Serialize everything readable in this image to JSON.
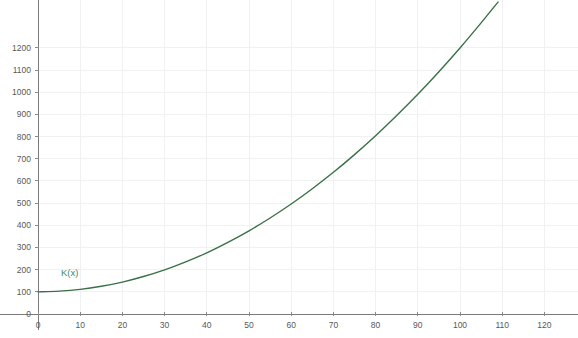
{
  "chart_data": {
    "type": "line",
    "title": "",
    "subtitle": "",
    "xlabel": "",
    "ylabel": "",
    "xlim": [
      -2,
      127
    ],
    "ylim": [
      -35,
      1420
    ],
    "grid": true,
    "grid_color": "#f0f1f3",
    "legend_position": "inline-annotation",
    "x_ticks": [
      0,
      10,
      20,
      30,
      40,
      50,
      60,
      70,
      80,
      90,
      100,
      110,
      120
    ],
    "x_tick_labels": [
      "0",
      "10",
      "20",
      "30",
      "40",
      "50",
      "60",
      "70",
      "80",
      "90",
      "100",
      "110",
      "120"
    ],
    "y_ticks": [
      0,
      100,
      200,
      300,
      400,
      500,
      600,
      700,
      800,
      900,
      1000,
      1100,
      1200
    ],
    "y_tick_labels": [
      "0",
      "100",
      "200",
      "300",
      "400",
      "500",
      "600",
      "700",
      "800",
      "900",
      "1000",
      "1100",
      "1200"
    ],
    "series": [
      {
        "name": "K(x)",
        "color": "#3a7048",
        "annotation_label": "K(x)",
        "annotation_x": 4,
        "annotation_y": 190,
        "formula": "K(x) = 100 + 0.11 * x^2",
        "x": [
          0,
          5,
          10,
          15,
          20,
          25,
          30,
          35,
          40,
          45,
          50,
          55,
          60,
          65,
          70,
          75,
          80,
          85,
          90,
          95,
          100,
          105,
          109
        ],
        "values": [
          100,
          103,
          111,
          125,
          144,
          169,
          199,
          235,
          276,
          323,
          375,
          433,
          496,
          565,
          639,
          719,
          804,
          895,
          991,
          1093,
          1200,
          1313,
          1407
        ]
      }
    ]
  },
  "axes": {
    "x_axis_name": "x-axis",
    "y_axis_name": "y-axis",
    "axis_color": "#7a7a7c"
  },
  "colors": {
    "background": "#ffffff",
    "curve": "#3a7048",
    "grid": "#f0f1f3",
    "axis": "#7a7a7c",
    "tick_text": "#58585a",
    "annotation": "#4a8a5e"
  }
}
